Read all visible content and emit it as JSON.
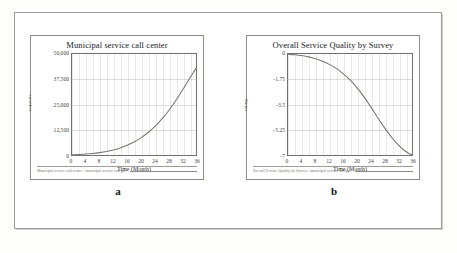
{
  "figure": {
    "background_color": "#fdfdfc",
    "frame_color": "#9a9a96"
  },
  "panels": [
    {
      "letter": "a",
      "name": "municipal-service-call-center",
      "legend_text": "Municipal service call center : municipal service call/get",
      "stray_mark": "",
      "chart_data": {
        "type": "line",
        "title": "Municipal service call center",
        "xlabel": "Time (Month)",
        "ylabel": "requests",
        "xlim": [
          0,
          36
        ],
        "ylim": [
          0,
          50000
        ],
        "grid": true,
        "legend_position": "below-axes",
        "xticks": [
          "0",
          "4",
          "8",
          "12",
          "16",
          "20",
          "24",
          "28",
          "32",
          "36"
        ],
        "yticks": [
          "0",
          "12,500",
          "25,000",
          "37,500",
          "50,000"
        ],
        "series": [
          {
            "name": "municipal service call center",
            "color": "#777773",
            "x": [
              0,
              2,
              4,
              6,
              8,
              10,
              12,
              14,
              16,
              18,
              20,
              22,
              24,
              26,
              28,
              30,
              32,
              34,
              36
            ],
            "y": [
              120,
              260,
              460,
              760,
              1180,
              1750,
              2520,
              3520,
              4820,
              6450,
              8500,
              11000,
              14000,
              17600,
              21800,
              26600,
              31900,
              37500,
              43000
            ]
          }
        ]
      }
    },
    {
      "letter": "b",
      "name": "overall-service-quality-by-survey",
      "legend_text": "Overall Service Quality by Survey : municipal service call/get",
      "stray_mark": "-",
      "chart_data": {
        "type": "line",
        "title": "Overall Service Quality by Survey",
        "xlabel": "Time (Month)",
        "ylabel": "rating",
        "xlim": [
          0,
          36
        ],
        "ylim": [
          -7,
          0
        ],
        "grid": true,
        "legend_position": "below-axes",
        "xticks": [
          "0",
          "4",
          "8",
          "12",
          "16",
          "20",
          "24",
          "28",
          "32",
          "36"
        ],
        "yticks": [
          "-7",
          "-5.25",
          "-3.5",
          "-1.75",
          "0"
        ],
        "series": [
          {
            "name": "overall service quality by survey",
            "color": "#777773",
            "x": [
              0,
              2,
              4,
              6,
              8,
              10,
              12,
              14,
              16,
              18,
              20,
              22,
              24,
              26,
              28,
              30,
              32,
              34,
              36
            ],
            "y": [
              -0.02,
              -0.05,
              -0.11,
              -0.2,
              -0.33,
              -0.5,
              -0.72,
              -1.0,
              -1.36,
              -1.8,
              -2.33,
              -2.95,
              -3.65,
              -4.4,
              -5.1,
              -5.75,
              -6.3,
              -6.72,
              -7.0
            ]
          }
        ]
      }
    }
  ]
}
